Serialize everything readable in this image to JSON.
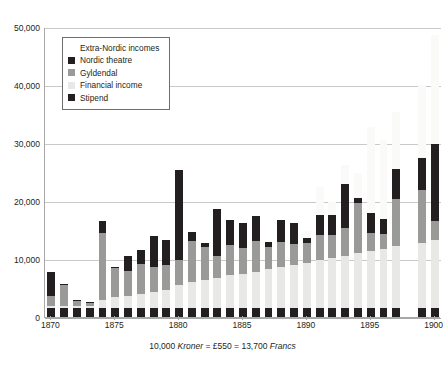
{
  "chart_data": {
    "type": "bar",
    "subtype": "stacked-bar",
    "title": "",
    "xlabel": "",
    "ylabel": "",
    "ylim": [
      0,
      50000
    ],
    "ytick_step": 10000,
    "ytick_labels": [
      "0",
      "10,000",
      "20,000",
      "30,000",
      "40,000",
      "50,000"
    ],
    "ytick_values": [
      0,
      10000,
      20000,
      30000,
      40000,
      50000
    ],
    "grid": true,
    "legend_position": "top-left",
    "x": [
      1870,
      1871,
      1872,
      1873,
      1874,
      1875,
      1876,
      1877,
      1878,
      1879,
      1880,
      1881,
      1882,
      1883,
      1884,
      1885,
      1886,
      1887,
      1888,
      1889,
      1890,
      1891,
      1892,
      1893,
      1894,
      1895,
      1896,
      1897,
      1898,
      1899,
      1900
    ],
    "xtick_labels": [
      "1870",
      "1875",
      "1880",
      "1885",
      "1890",
      "1895",
      "1900"
    ],
    "xtick_values": [
      1870,
      1875,
      1880,
      1885,
      1890,
      1895,
      1900
    ],
    "series": [
      {
        "name": "Stipend",
        "color": "#231f20",
        "values": [
          1600,
          1600,
          1600,
          1600,
          1600,
          1600,
          1600,
          1600,
          1600,
          1600,
          1600,
          1600,
          1600,
          1600,
          1600,
          1600,
          1600,
          1600,
          1600,
          1600,
          1600,
          1600,
          1600,
          1600,
          1600,
          1600,
          1600,
          1600,
          0,
          1600,
          1600
        ]
      },
      {
        "name": "Financial income",
        "color": "#e8e8e6",
        "values": [
          300,
          300,
          300,
          300,
          1300,
          1900,
          2100,
          2400,
          2700,
          3000,
          3900,
          4400,
          4700,
          5200,
          5600,
          5900,
          6200,
          6600,
          7000,
          7400,
          7800,
          8200,
          8600,
          9000,
          9400,
          9800,
          10200,
          10600,
          0,
          11200,
          11600
        ]
      },
      {
        "name": "Gyldendal",
        "color": "#9a9a98",
        "values": [
          1700,
          3600,
          900,
          500,
          11600,
          4900,
          4300,
          5200,
          4300,
          4300,
          4300,
          7100,
          5700,
          3700,
          5300,
          4400,
          5300,
          3800,
          4400,
          3600,
          3300,
          4300,
          3900,
          4700,
          8700,
          3100,
          2600,
          8200,
          0,
          9100,
          3400
        ]
      },
      {
        "name": "Nordic theatre",
        "color": "#231f20",
        "values": [
          4100,
          200,
          200,
          200,
          2000,
          200,
          2500,
          2400,
          5300,
          4300,
          15500,
          1500,
          700,
          8100,
          4300,
          4300,
          4300,
          1000,
          3700,
          3600,
          900,
          3500,
          3500,
          7700,
          800,
          3500,
          2500,
          5200,
          0,
          5500,
          13300
        ]
      },
      {
        "name": "Extra-Nordic incomes",
        "color": "#fafaf8",
        "values": [
          0,
          0,
          0,
          0,
          0,
          0,
          0,
          0,
          0,
          0,
          0,
          0,
          0,
          0,
          0,
          0,
          0,
          0,
          0,
          0,
          1200,
          4800,
          2300,
          3200,
          4300,
          14800,
          13600,
          9800,
          0,
          12600,
          18700
        ]
      }
    ]
  },
  "legend": {
    "title_row": "Extra-Nordic incomes",
    "items": [
      {
        "label": "Extra-Nordic incomes",
        "color": "#fafaf8"
      },
      {
        "label": "Nordic theatre",
        "color": "#231f20"
      },
      {
        "label": "Gyldendal",
        "color": "#9a9a98"
      },
      {
        "label": "Financial income",
        "color": "#e8e8e6"
      },
      {
        "label": "Stipend",
        "color": "#231f20"
      }
    ]
  },
  "caption": {
    "amount": "10,000 ",
    "currency_1": "Kroner",
    "equals_1": " = £550 = 13,700 ",
    "currency_2": "Francs"
  }
}
